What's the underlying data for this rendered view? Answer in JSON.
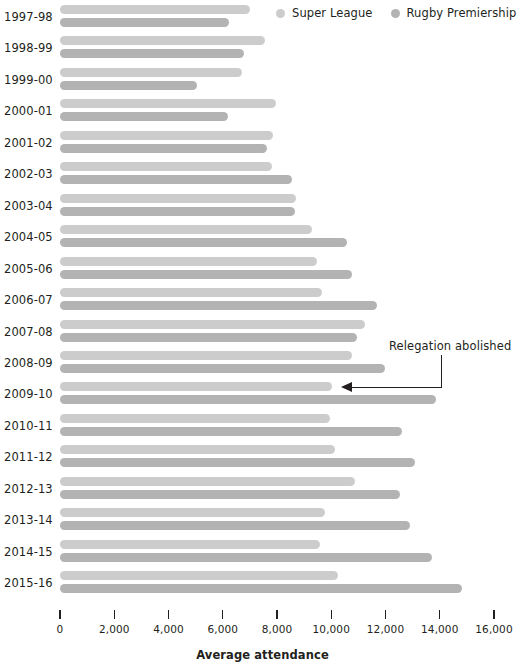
{
  "chart_data": {
    "type": "bar",
    "orientation": "horizontal",
    "title": "",
    "xlabel": "Average attendance",
    "ylabel": "",
    "xlim": [
      0,
      16000
    ],
    "xticks": [
      0,
      2000,
      4000,
      6000,
      8000,
      10000,
      12000,
      14000,
      16000
    ],
    "xticklabels": [
      "0",
      "2,000",
      "4,000",
      "6,000",
      "8,000",
      "10,000",
      "12,000",
      "14,000",
      "16,000"
    ],
    "grid": false,
    "legend_position": "top-right",
    "categories": [
      "1997-98",
      "1998-99",
      "1999-00",
      "2000-01",
      "2001-02",
      "2002-03",
      "2003-04",
      "2004-05",
      "2005-06",
      "2006-07",
      "2007-08",
      "2008-09",
      "2009-10",
      "2010-11",
      "2011-12",
      "2012-13",
      "2013-14",
      "2014-15",
      "2015-16"
    ],
    "series": [
      {
        "name": "Super League",
        "color": "#cccccc",
        "values": [
          7000,
          7550,
          6700,
          7960,
          7850,
          7800,
          8700,
          9280,
          9460,
          9650,
          11240,
          10750,
          10030,
          9960,
          10140,
          10880,
          9770,
          9580,
          10250
        ]
      },
      {
        "name": "Rugby Premiership",
        "color": "#b3b3b3",
        "values": [
          6230,
          6800,
          5050,
          6200,
          7630,
          8540,
          8660,
          10570,
          10750,
          11680,
          10950,
          11980,
          13880,
          12610,
          13090,
          12540,
          12900,
          13720,
          14810
        ]
      }
    ],
    "annotations": [
      {
        "text": "Relegation abolished",
        "points_to_category": "2009-10",
        "points_to_series": "Super League"
      }
    ]
  },
  "legend": {
    "items": [
      {
        "label": "Super League",
        "color": "#cccccc"
      },
      {
        "label": "Rugby Premiership",
        "color": "#b3b3b3"
      }
    ]
  },
  "axis": {
    "title": "Average attendance"
  },
  "colors": {
    "super_league": "#cccccc",
    "rugby_premiership": "#b3b3b3",
    "text": "#231f20",
    "background": "#ffffff"
  }
}
